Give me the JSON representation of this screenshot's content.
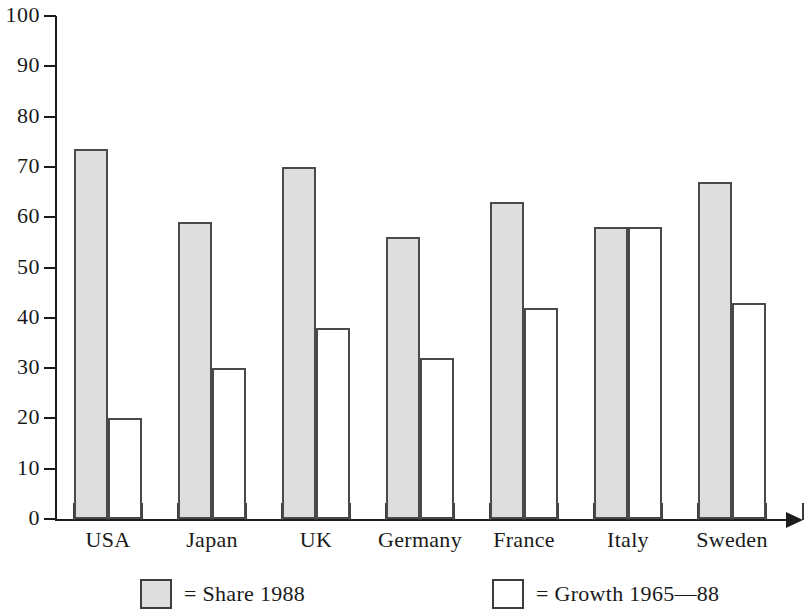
{
  "chart_data": {
    "type": "bar",
    "title": "",
    "subtitle": "",
    "xlabel": "",
    "ylabel": "",
    "ylim": [
      0,
      100
    ],
    "y_ticks": [
      0,
      10,
      20,
      30,
      40,
      50,
      60,
      70,
      80,
      90,
      100
    ],
    "y_tick_labels": [
      "0",
      "10",
      "20",
      "30",
      "40",
      "50",
      "60",
      "70",
      "80",
      "90",
      "100"
    ],
    "grid": false,
    "legend_position": "bottom",
    "categories": [
      "USA",
      "Japan",
      "UK",
      "Germany",
      "France",
      "Italy",
      "Sweden"
    ],
    "series": [
      {
        "name": "Share 1988",
        "legend_label": "= Share 1988",
        "swatch": "share",
        "color": "#dedede",
        "values": [
          73.5,
          59,
          70,
          56,
          63,
          58,
          67
        ]
      },
      {
        "name": "Growth 1965—88",
        "legend_label": "= Growth 1965—88",
        "swatch": "growth",
        "color": "#ffffff",
        "values": [
          20,
          30,
          38,
          32,
          42,
          58,
          43
        ]
      }
    ]
  },
  "axis": {
    "arrow_on_x_axis": true,
    "axis_color": "#1c1c1c"
  }
}
